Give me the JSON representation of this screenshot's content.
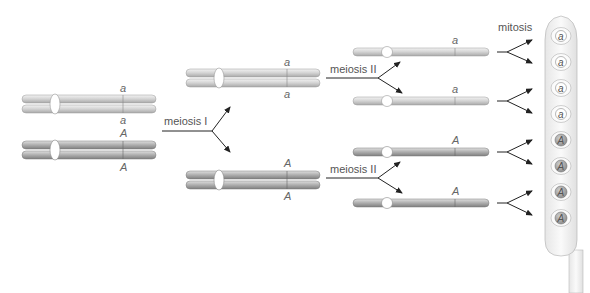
{
  "labels": {
    "meiosis1": "meiosis I",
    "meiosis2_top": "meiosis II",
    "meiosis2_bottom": "meiosis II",
    "mitosis": "mitosis"
  },
  "parent": {
    "pair_a": {
      "top_allele": "a",
      "bottom_allele": "a"
    },
    "pair_A": {
      "top_allele": "A",
      "bottom_allele": "A"
    }
  },
  "meiosis1_products": {
    "upper": {
      "top_allele": "a",
      "bottom_allele": "a"
    },
    "lower": {
      "top_allele": "A",
      "bottom_allele": "A"
    }
  },
  "meiosis2_products": [
    {
      "allele": "a"
    },
    {
      "allele": "a"
    },
    {
      "allele": "A"
    },
    {
      "allele": "A"
    }
  ],
  "cells": [
    {
      "allele": "a"
    },
    {
      "allele": "a"
    },
    {
      "allele": "a"
    },
    {
      "allele": "a"
    },
    {
      "allele": "A"
    },
    {
      "allele": "A"
    },
    {
      "allele": "A"
    },
    {
      "allele": "A"
    }
  ],
  "colors": {
    "chromosome_a": "#d9d9d9",
    "chromosome_A": "#b3b3b3",
    "cell_nucleus_a": "#ffffff",
    "cell_nucleus_A": "#a8a8a8",
    "arrow": "#222222"
  }
}
